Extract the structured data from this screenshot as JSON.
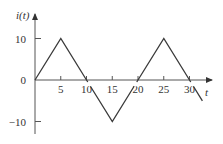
{
  "chart_data": {
    "type": "line",
    "title": "",
    "xlabel": "t",
    "ylabel": "i(t)",
    "x": [
      0,
      5,
      10,
      15,
      20,
      25,
      30,
      32.5
    ],
    "series": [
      {
        "name": "i(t)",
        "values": [
          0,
          10,
          0,
          -10,
          0,
          10,
          0,
          -5
        ]
      }
    ],
    "xticks": [
      5,
      10,
      15,
      20,
      25,
      30
    ],
    "xtick_labels": [
      "5",
      "10",
      "15",
      "20",
      "25",
      "30"
    ],
    "yticks": [
      10,
      0,
      -10
    ],
    "ytick_labels": [
      "10",
      "0",
      "−10"
    ],
    "xlim": [
      0,
      34
    ],
    "ylim": [
      -12,
      13
    ],
    "grid": false,
    "legend": "none",
    "waveform": "triangular",
    "period": 20,
    "amplitude": 10,
    "colors": {
      "line": "#3a3a3a",
      "axis": "#555555",
      "text": "#333333"
    }
  }
}
